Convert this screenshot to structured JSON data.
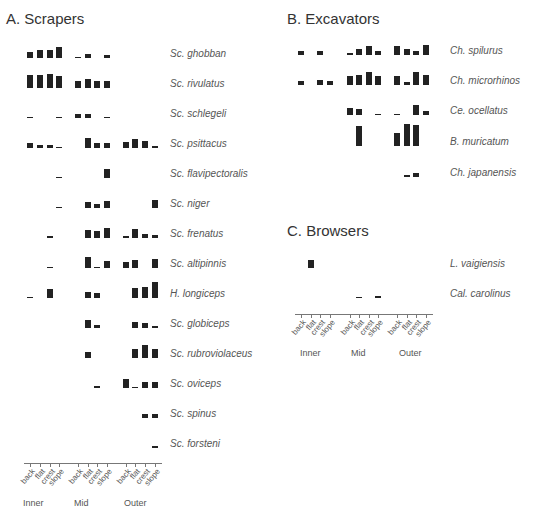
{
  "chart_data": [
    {
      "type": "bar",
      "title": "A. Scrapers",
      "zones": [
        "Inner",
        "Mid",
        "Outer"
      ],
      "habitats": [
        "back",
        "flat",
        "crest",
        "slope"
      ],
      "categories": [
        "Inner-back",
        "Inner-flat",
        "Inner-crest",
        "Inner-slope",
        "Mid-back",
        "Mid-flat",
        "Mid-crest",
        "Mid-slope",
        "Outer-back",
        "Outer-flat",
        "Outer-crest",
        "Outer-slope"
      ],
      "series": [
        {
          "name": "Sc. ghobban",
          "values": [
            6,
            8,
            8,
            12,
            1,
            4,
            0,
            3,
            0,
            0,
            0,
            0
          ]
        },
        {
          "name": "Sc. rivulatus",
          "values": [
            14,
            14,
            15,
            13,
            7,
            9,
            7,
            7,
            0,
            0,
            0,
            0
          ]
        },
        {
          "name": "Sc. schlegeli",
          "values": [
            1,
            0,
            0,
            1,
            4,
            4,
            0,
            1,
            0,
            0,
            0,
            0
          ]
        },
        {
          "name": "Sc. psittacus",
          "values": [
            5,
            3,
            3,
            1,
            0,
            11,
            5,
            5,
            6,
            9,
            7,
            2
          ]
        },
        {
          "name": "Sc. flavipectoralis",
          "values": [
            0,
            0,
            0,
            1,
            0,
            0,
            0,
            9,
            0,
            0,
            0,
            0
          ]
        },
        {
          "name": "Sc. niger",
          "values": [
            0,
            0,
            0,
            1,
            0,
            6,
            4,
            7,
            0,
            0,
            0,
            8
          ]
        },
        {
          "name": "Sc. frenatus",
          "values": [
            0,
            0,
            2,
            0,
            0,
            8,
            7,
            11,
            2,
            10,
            4,
            3
          ]
        },
        {
          "name": "Sc. altipinnis",
          "values": [
            0,
            0,
            1,
            0,
            0,
            12,
            1,
            7,
            6,
            8,
            0,
            9
          ]
        },
        {
          "name": "H. longiceps",
          "values": [
            1,
            0,
            10,
            0,
            0,
            6,
            5,
            0,
            0,
            11,
            12,
            17
          ]
        },
        {
          "name": "Sc. globiceps",
          "values": [
            0,
            0,
            0,
            0,
            0,
            8,
            3,
            0,
            0,
            6,
            5,
            2
          ]
        },
        {
          "name": "Sc. rubroviolaceus",
          "values": [
            0,
            0,
            0,
            0,
            0,
            6,
            0,
            0,
            0,
            9,
            14,
            9
          ]
        },
        {
          "name": "Sc. oviceps",
          "values": [
            0,
            0,
            0,
            0,
            0,
            0,
            2,
            0,
            10,
            1,
            6,
            6
          ]
        },
        {
          "name": "Sc. spinus",
          "values": [
            0,
            0,
            0,
            0,
            0,
            0,
            0,
            0,
            0,
            0,
            4,
            4
          ]
        },
        {
          "name": "Sc. forsteni",
          "values": [
            0,
            0,
            0,
            0,
            0,
            0,
            0,
            0,
            0,
            0,
            0,
            2
          ]
        }
      ],
      "xlabel": "",
      "ylabel": ""
    },
    {
      "type": "bar",
      "title": "B. Excavators",
      "categories": [
        "Inner-back",
        "Inner-flat",
        "Inner-crest",
        "Inner-slope",
        "Mid-back",
        "Mid-flat",
        "Mid-crest",
        "Mid-slope",
        "Outer-back",
        "Outer-flat",
        "Outer-crest",
        "Outer-slope"
      ],
      "series": [
        {
          "name": "Ch. spilurus",
          "values": [
            5,
            0,
            4,
            0,
            2,
            7,
            10,
            5,
            10,
            7,
            4,
            11
          ]
        },
        {
          "name": "Ch. microrhinos",
          "values": [
            5,
            0,
            6,
            4,
            10,
            11,
            14,
            10,
            10,
            3,
            14,
            11
          ]
        },
        {
          "name": "Ce. ocellatus",
          "values": [
            0,
            0,
            0,
            0,
            8,
            7,
            0,
            1,
            1,
            0,
            11,
            5
          ]
        },
        {
          "name": "B. muricatum",
          "values": [
            0,
            0,
            0,
            0,
            0,
            22,
            0,
            0,
            14,
            25,
            23,
            0
          ]
        },
        {
          "name": "Ch. japanensis",
          "values": [
            0,
            0,
            0,
            0,
            0,
            0,
            0,
            0,
            0,
            2,
            5,
            0
          ]
        }
      ]
    },
    {
      "type": "bar",
      "title": "C. Browsers",
      "categories": [
        "Inner-back",
        "Inner-flat",
        "Inner-crest",
        "Inner-slope",
        "Mid-back",
        "Mid-flat",
        "Mid-crest",
        "Mid-slope",
        "Outer-back",
        "Outer-flat",
        "Outer-crest",
        "Outer-slope"
      ],
      "series": [
        {
          "name": "L. vaigiensis",
          "values": [
            0,
            8,
            0,
            0,
            0,
            0,
            0,
            0,
            0,
            0,
            0,
            0
          ]
        },
        {
          "name": "Cal. carolinus",
          "values": [
            0,
            0,
            0,
            0,
            0,
            1,
            0,
            2,
            0,
            0,
            0,
            0
          ]
        }
      ]
    }
  ],
  "panels": {
    "a": {
      "title": "A. Scrapers"
    },
    "b": {
      "title": "B. Excavators"
    },
    "c": {
      "title": "C. Browsers"
    }
  },
  "axis": {
    "habitats": [
      "back",
      "flat",
      "crest",
      "slope"
    ],
    "zones": [
      "Inner",
      "Mid",
      "Outer"
    ]
  }
}
